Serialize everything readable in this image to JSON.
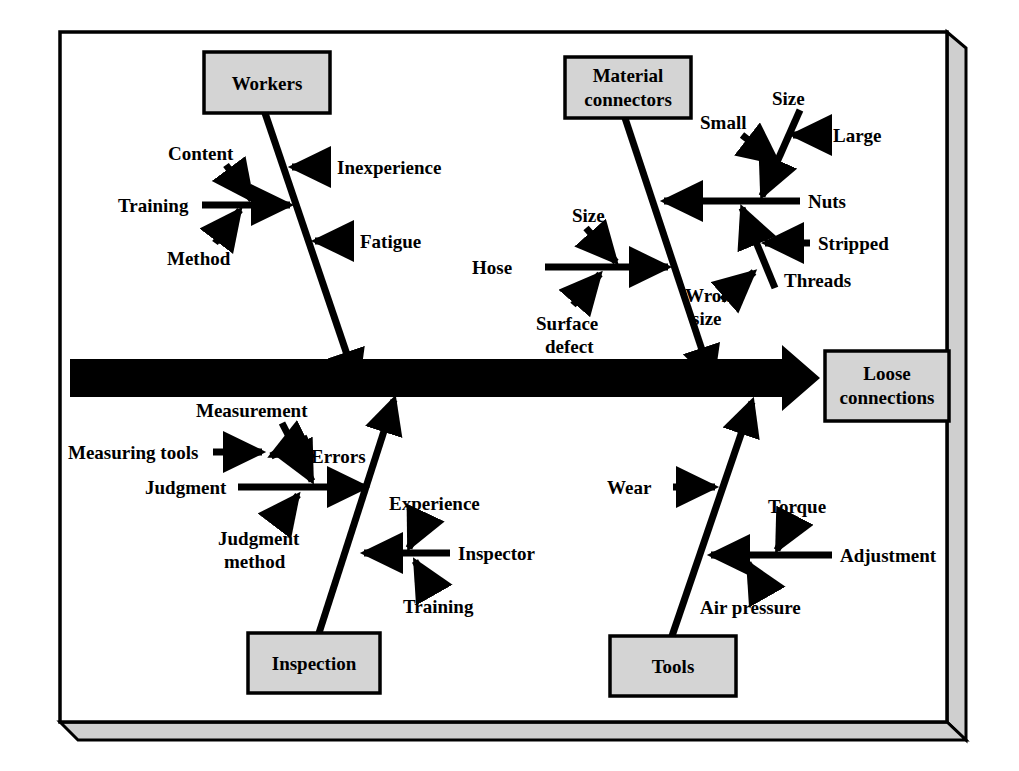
{
  "diagram": {
    "type": "fishbone",
    "effect": {
      "label": "Loose connections",
      "lines": [
        "Loose",
        "connections"
      ]
    },
    "colors": {
      "ink": "#000000",
      "box_fill": "#d4d4d4",
      "frame_bevel": "#cfcfcf",
      "page": "#ffffff"
    },
    "categories": [
      {
        "id": "workers",
        "label": "Workers",
        "position": "top-left",
        "causes": [
          {
            "label": "Inexperience",
            "side": "right"
          },
          {
            "label": "Fatigue",
            "side": "right"
          },
          {
            "label": "Training",
            "side": "left",
            "sub": [
              {
                "label": "Content"
              },
              {
                "label": "Method"
              }
            ]
          }
        ]
      },
      {
        "id": "material-connectors",
        "label": "Material connectors",
        "lines": [
          "Material",
          "connectors"
        ],
        "position": "top-right",
        "causes": [
          {
            "label": "Nuts",
            "side": "right",
            "sub": [
              {
                "label": "Size",
                "subsub": [
                  {
                    "label": "Small"
                  },
                  {
                    "label": "Large"
                  }
                ]
              },
              {
                "label": "Threads",
                "subsub": [
                  {
                    "label": "Stripped"
                  }
                ]
              }
            ]
          },
          {
            "label": "Hose",
            "side": "left",
            "sub": [
              {
                "label": "Size"
              },
              {
                "label": "Surface defect",
                "lines": [
                  "Surface",
                  "defect"
                ]
              }
            ]
          },
          {
            "label": "Wrong size",
            "lines": [
              "Wrong",
              "size"
            ],
            "side": "inline"
          }
        ]
      },
      {
        "id": "inspection",
        "label": "Inspection",
        "position": "bottom-left",
        "causes": [
          {
            "label": "Judgment",
            "side": "left",
            "sub": [
              {
                "label": "Measurement"
              },
              {
                "label": "Errors"
              },
              {
                "label": "Measuring tools"
              },
              {
                "label": "Judgment method",
                "lines": [
                  "Judgment",
                  "method"
                ]
              }
            ]
          },
          {
            "label": "Inspector",
            "side": "right",
            "sub": [
              {
                "label": "Experience"
              },
              {
                "label": "Training"
              }
            ]
          }
        ]
      },
      {
        "id": "tools",
        "label": "Tools",
        "position": "bottom-right",
        "causes": [
          {
            "label": "Wear",
            "side": "left"
          },
          {
            "label": "Adjustment",
            "side": "right",
            "sub": [
              {
                "label": "Torque"
              },
              {
                "label": "Air pressure"
              }
            ]
          }
        ]
      }
    ],
    "labels": {
      "workers": "Workers",
      "material_l1": "Material",
      "material_l2": "connectors",
      "inspection": "Inspection",
      "tools": "Tools",
      "effect_l1": "Loose",
      "effect_l2": "connections",
      "inexperience": "Inexperience",
      "fatigue": "Fatigue",
      "training_w": "Training",
      "content": "Content",
      "method": "Method",
      "size_nuts": "Size",
      "small": "Small",
      "large": "Large",
      "nuts": "Nuts",
      "stripped": "Stripped",
      "threads": "Threads",
      "size_hose": "Size",
      "hose": "Hose",
      "surface_l1": "Surface",
      "surface_l2": "defect",
      "wrong_l1": "Wrong",
      "wrong_l2": "size",
      "measurement": "Measurement",
      "measuring_tools": "Measuring tools",
      "errors": "Errors",
      "judgment": "Judgment",
      "judgment_m_l1": "Judgment",
      "judgment_m_l2": "method",
      "experience": "Experience",
      "inspector": "Inspector",
      "training_i": "Training",
      "wear": "Wear",
      "torque": "Torque",
      "adjustment": "Adjustment",
      "air_pressure": "Air pressure"
    }
  }
}
